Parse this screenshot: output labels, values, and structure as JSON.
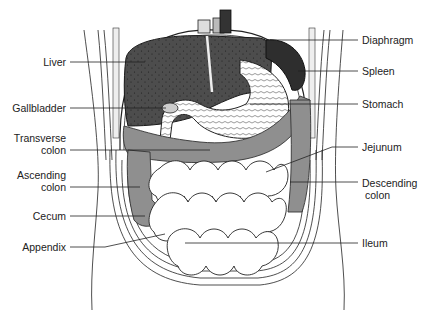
{
  "colors": {
    "organ_dark": "#4a4a4a",
    "spleen": "#2e2e2e",
    "colon": "#8f8f8f",
    "outline": "#1a1a1a",
    "background": "#ffffff",
    "text": "#222222"
  },
  "labels": {
    "left": [
      {
        "id": "liver",
        "lines": [
          "Liver"
        ]
      },
      {
        "id": "gallbladder",
        "lines": [
          "Gallbladder"
        ]
      },
      {
        "id": "transverse-colon",
        "lines": [
          "Transverse",
          "colon"
        ]
      },
      {
        "id": "ascending-colon",
        "lines": [
          "Ascending",
          "colon"
        ]
      },
      {
        "id": "cecum",
        "lines": [
          "Cecum"
        ]
      },
      {
        "id": "appendix",
        "lines": [
          "Appendix"
        ]
      }
    ],
    "right": [
      {
        "id": "diaphragm",
        "lines": [
          "Diaphragm"
        ]
      },
      {
        "id": "spleen",
        "lines": [
          "Spleen"
        ]
      },
      {
        "id": "stomach",
        "lines": [
          "Stomach"
        ]
      },
      {
        "id": "jejunum",
        "lines": [
          "Jejunum"
        ]
      },
      {
        "id": "descending-colon",
        "lines": [
          "Descending",
          "colon"
        ]
      },
      {
        "id": "ileum",
        "lines": [
          "Ileum"
        ]
      }
    ]
  }
}
